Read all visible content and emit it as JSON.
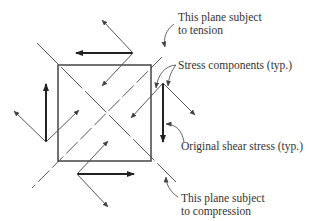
{
  "labels": {
    "tension_line1": "This plane subject",
    "tension_line2": "to tension",
    "stress_components": "Stress components (typ.)",
    "original_shear": "Original shear stress (typ.)",
    "compression_line1": "This plane subject",
    "compression_line2": "to compression"
  },
  "colors": {
    "line": "#444444",
    "heavy": "#222222",
    "text": "#333333",
    "background": "#ffffff"
  }
}
